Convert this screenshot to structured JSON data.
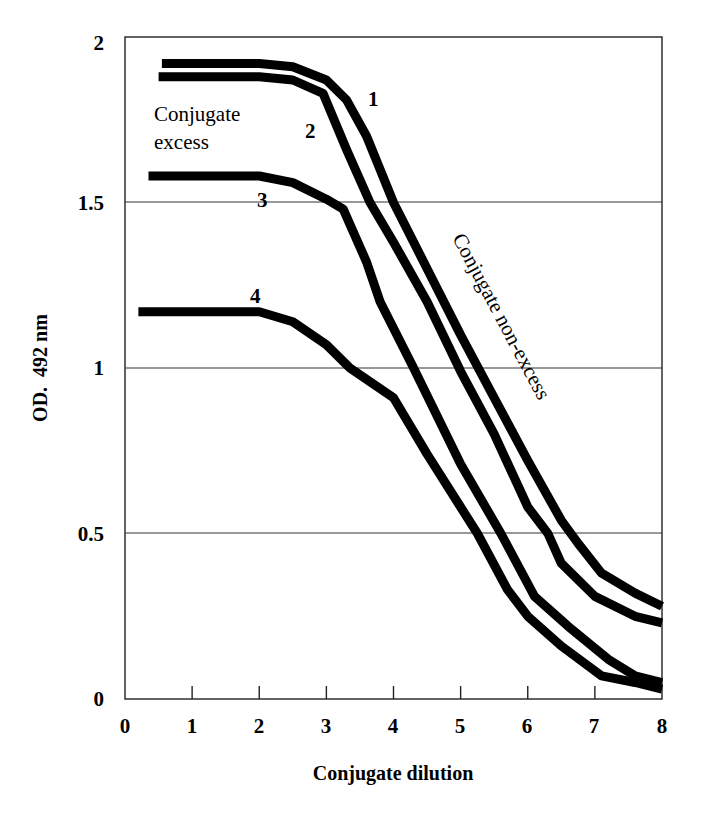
{
  "chart_data": {
    "type": "line",
    "title": "",
    "xlabel": "Conjugate dilution",
    "ylabel": "OD. 492 nm",
    "xlim": [
      0,
      8
    ],
    "ylim": [
      0,
      2
    ],
    "x_ticks": [
      "0",
      "1",
      "2",
      "3",
      "4",
      "5",
      "6",
      "7",
      "8"
    ],
    "y_ticks": [
      "0",
      "0.5",
      "1",
      "1.5",
      "2"
    ],
    "grid": {
      "horizontal": [
        0.5,
        1,
        1.5
      ],
      "vertical": false
    },
    "legend": null,
    "series": [
      {
        "name": "1",
        "x": [
          0.55,
          2.0,
          2.5,
          3.0,
          3.3,
          3.6,
          4.0,
          4.5,
          5.0,
          5.5,
          6.0,
          6.5,
          6.75,
          7.1,
          7.6,
          8.0
        ],
        "y": [
          1.92,
          1.92,
          1.91,
          1.87,
          1.81,
          1.7,
          1.5,
          1.3,
          1.1,
          0.91,
          0.72,
          0.54,
          0.47,
          0.38,
          0.32,
          0.28
        ]
      },
      {
        "name": "2",
        "x": [
          0.5,
          2.0,
          2.5,
          2.95,
          3.3,
          3.65,
          4.0,
          4.5,
          5.0,
          5.5,
          6.0,
          6.3,
          6.5,
          7.0,
          7.6,
          8.0
        ],
        "y": [
          1.88,
          1.88,
          1.87,
          1.83,
          1.66,
          1.5,
          1.38,
          1.2,
          0.99,
          0.8,
          0.58,
          0.5,
          0.41,
          0.31,
          0.25,
          0.23
        ]
      },
      {
        "name": "3",
        "x": [
          0.35,
          2.0,
          2.5,
          3.0,
          3.25,
          3.6,
          3.8,
          4.0,
          4.3,
          5.0,
          5.6,
          6.1,
          6.6,
          7.2,
          7.6,
          8.0
        ],
        "y": [
          1.58,
          1.58,
          1.56,
          1.51,
          1.48,
          1.32,
          1.2,
          1.12,
          1.0,
          0.71,
          0.5,
          0.31,
          0.22,
          0.12,
          0.07,
          0.05
        ]
      },
      {
        "name": "4",
        "x": [
          0.2,
          2.0,
          2.5,
          3.0,
          3.35,
          4.0,
          4.5,
          5.0,
          5.25,
          5.7,
          6.0,
          6.5,
          7.1,
          7.6,
          8.0
        ],
        "y": [
          1.17,
          1.17,
          1.14,
          1.07,
          1.0,
          0.91,
          0.74,
          0.58,
          0.5,
          0.33,
          0.25,
          0.16,
          0.07,
          0.05,
          0.03
        ]
      }
    ],
    "annotations": [
      {
        "text": "Conjugate excess",
        "x": 0.45,
        "y": 1.72
      },
      {
        "text": "Conjugate non-excess",
        "x": 5.3,
        "y": 1.2,
        "rotation_deg": 62
      },
      {
        "text": "1",
        "x": 3.75,
        "y": 1.81
      },
      {
        "text": "2",
        "x": 2.85,
        "y": 1.72
      },
      {
        "text": "3",
        "x": 2.05,
        "y": 1.49
      },
      {
        "text": "4",
        "x": 1.95,
        "y": 1.22
      }
    ]
  },
  "labels": {
    "xlabel": "Conjugate dilution",
    "ylabel": "OD.  492 nm",
    "annot_excess_line1": "Conjugate",
    "annot_excess_line2": "excess",
    "annot_nonexcess": "Conjugate non-excess",
    "curve1": "1",
    "curve2": "2",
    "curve3": "3",
    "curve4": "4",
    "xticks": [
      "0",
      "1",
      "2",
      "3",
      "4",
      "5",
      "6",
      "7",
      "8"
    ],
    "yticks": [
      "0",
      "0.5",
      "1",
      "1.5",
      "2"
    ]
  }
}
